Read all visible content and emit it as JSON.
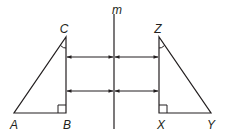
{
  "diagram": {
    "type": "reflection",
    "line_label": "m",
    "stroke_color": "#231f20",
    "triangle_left": {
      "vertices": [
        "A",
        "B",
        "C"
      ],
      "right_angle_at": "B",
      "marked_angle_at": "C"
    },
    "triangle_right": {
      "vertices": [
        "X",
        "Y",
        "Z"
      ],
      "right_angle_at": "X",
      "marked_angle_at": "Z"
    },
    "labels": {
      "m": "m",
      "A": "A",
      "B": "B",
      "C": "C",
      "X": "X",
      "Y": "Y",
      "Z": "Z"
    },
    "arrows": [
      {
        "description": "double arrow from C-B side to line m (upper)"
      },
      {
        "description": "double arrow from line m to Z-X side (upper)"
      },
      {
        "description": "double arrow from C-B side to line m (lower)"
      },
      {
        "description": "double arrow from line m to Z-X side (lower)"
      }
    ]
  }
}
